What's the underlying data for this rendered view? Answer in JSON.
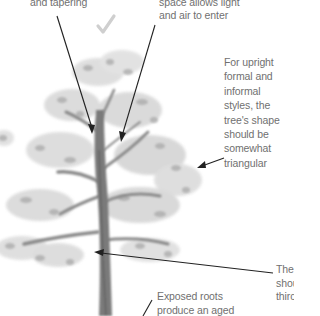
{
  "annotations": {
    "trunk_taper": {
      "lines": [
        "and tapering"
      ]
    },
    "canopy_space": {
      "lines": [
        "space allows light",
        "and air to enter"
      ]
    },
    "tree_shape": {
      "lines": [
        "For upright",
        "formal and",
        "informal",
        "styles, the",
        "tree's shape",
        "should be",
        "somewhat",
        "triangular"
      ]
    },
    "first_branch": {
      "lines": [
        "The",
        "shou",
        "thirc"
      ]
    },
    "exposed_roots": {
      "lines": [
        "Exposed roots",
        "produce an aged"
      ]
    }
  },
  "icons": {
    "checkmark": "checkmark-icon"
  },
  "colors": {
    "text": "#707070",
    "arrow": "#222222",
    "foliage": "#9a9a9a",
    "trunk": "#6e6e6e",
    "checkmark": "#c8c8c8"
  }
}
